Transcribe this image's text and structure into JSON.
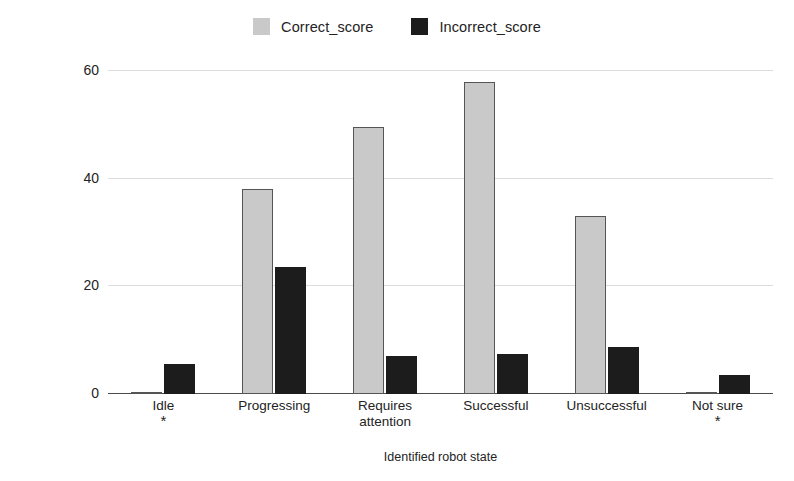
{
  "chart_data": {
    "type": "bar",
    "title": "",
    "xlabel": "Identified robot state",
    "ylabel": "Selection score (%)",
    "ylim": [
      0,
      62
    ],
    "yticks": [
      0,
      20,
      40,
      60
    ],
    "ytick_labels": [
      "0",
      "20",
      "40",
      "60"
    ],
    "grid": true,
    "legend_position": "top-center",
    "categories": [
      "Idle",
      "Progressing",
      "Requires attention",
      "Successful",
      "Unsuccessful",
      "Not sure"
    ],
    "category_lines": [
      [
        "Idle"
      ],
      [
        "Progressing"
      ],
      [
        "Requires",
        "attention"
      ],
      [
        "Successful"
      ],
      [
        "Unsuccessful"
      ],
      [
        "Not sure"
      ]
    ],
    "category_markers": [
      "*",
      "",
      "",
      "",
      "",
      "*"
    ],
    "series": [
      {
        "name": "Correct_score",
        "color": "#c9c9c9",
        "values": [
          0.3,
          38.0,
          49.5,
          58.0,
          33.0,
          0.3
        ]
      },
      {
        "name": "Incorrect_score",
        "color": "#1c1c1c",
        "values": [
          5.6,
          23.5,
          7.0,
          7.5,
          8.7,
          3.5
        ]
      }
    ]
  },
  "legend": {
    "items": [
      {
        "label": "Correct_score",
        "swatch": "light-gray-square"
      },
      {
        "label": "Incorrect_score",
        "swatch": "black-square"
      }
    ]
  },
  "axes": {
    "y_title": "Selection score (%)",
    "x_title": "Identified robot state"
  }
}
